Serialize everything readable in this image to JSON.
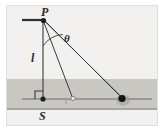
{
  "figure": {
    "background_color": "#f2f1ef",
    "frame_color": "#e8e7e5",
    "ground_band_color": "#c9c7c2",
    "ground_line_color": "#9a9894",
    "stroke_color": "#3a3a3a",
    "labels": {
      "pivot": "P",
      "angle": "θ",
      "length": "l",
      "base": "S"
    },
    "points": {
      "pivot_P": {
        "x": 43,
        "y": 20
      },
      "base_S": {
        "x": 43,
        "y": 99
      },
      "mid_bob": {
        "x": 73,
        "y": 99
      },
      "far_bob": {
        "x": 122,
        "y": 99
      }
    },
    "geometry": {
      "ceiling_line": {
        "x1": 22,
        "y1": 20,
        "x2": 43,
        "y2": 20
      },
      "ground_line": {
        "x1": 22,
        "y1": 99,
        "x2": 152,
        "y2": 99
      },
      "string_vertical": {
        "x1": 43,
        "y1": 20,
        "x2": 43,
        "y2": 99
      },
      "string_mid": {
        "x1": 43,
        "y1": 20,
        "x2": 73,
        "y2": 99
      },
      "string_far_upper": {
        "x1": 43,
        "y1": 20,
        "x2": 122,
        "y2": 97
      },
      "string_far_lower": {
        "x1": 45,
        "y1": 22,
        "x2": 123,
        "y2": 100
      },
      "right_angle_marker_size": 8,
      "angle_arc_radius": 26,
      "shaded_band": {
        "top": 79,
        "bottom": 110
      }
    }
  }
}
